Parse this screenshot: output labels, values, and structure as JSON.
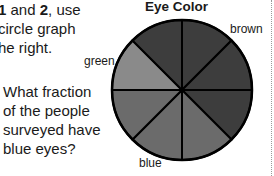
{
  "intro": {
    "line1_bold_a": "1",
    "line1_mid": " and ",
    "line1_bold_b": "2",
    "line1_end": ", use",
    "line2": "circle graph",
    "line3": "he right."
  },
  "question": {
    "line1": "What fraction",
    "line2": "of the people",
    "line3": "surveyed have",
    "line4": "blue eyes?"
  },
  "chart_data": {
    "type": "pie",
    "title": "Eye Color",
    "categories": [
      "brown",
      "green",
      "blue"
    ],
    "values": [
      4,
      1,
      3
    ],
    "total_sections": 8,
    "section_fraction": "1/8",
    "colors": {
      "brown": "#3d3d3d",
      "green": "#8a8a8a",
      "blue": "#6b6b6b",
      "outline": "#000000"
    },
    "legend": "inline labels",
    "grid": false
  },
  "labels": {
    "brown": "brown",
    "green": "green",
    "blue": "blue"
  }
}
